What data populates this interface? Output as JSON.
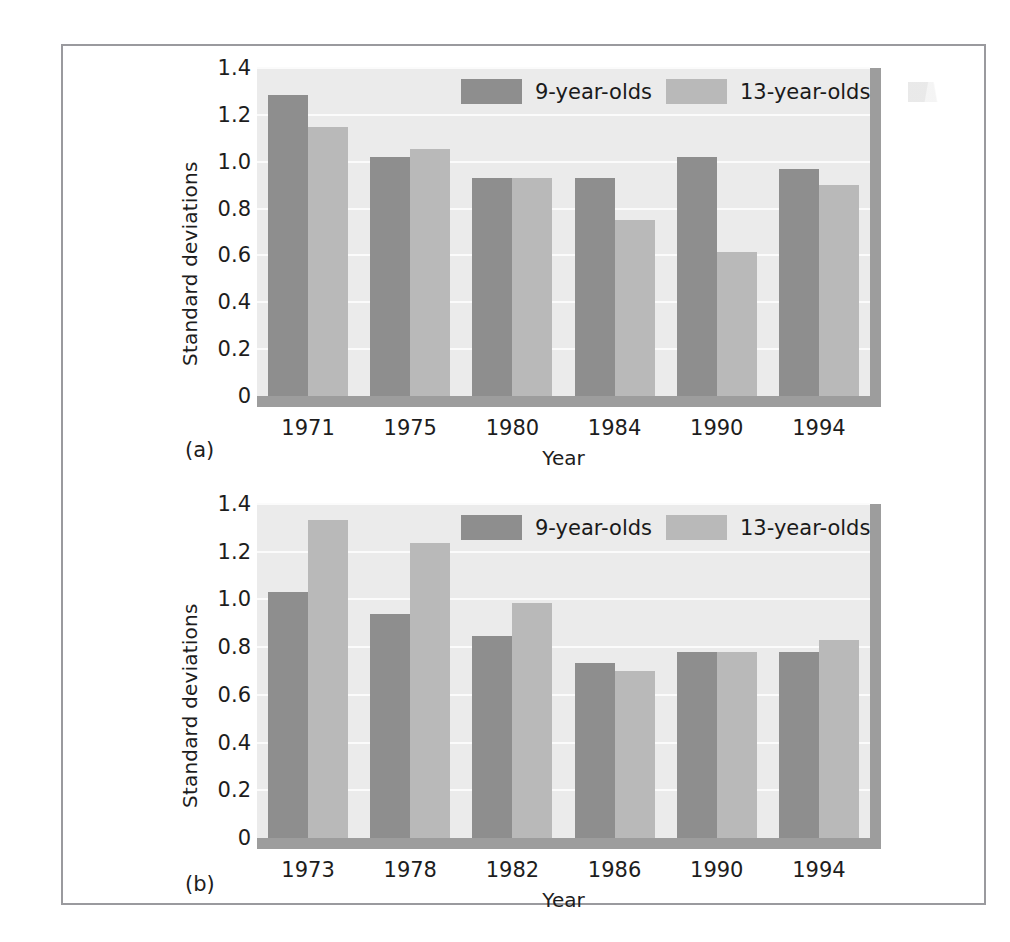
{
  "figure": {
    "panels": [
      {
        "caption": "(a)",
        "ylabel": "Standard deviations",
        "xlabel": "Year",
        "legend": [
          {
            "label": "9-year-olds",
            "color": "#8e8e8e"
          },
          {
            "label": "13-year-olds",
            "color": "#b9b9b9"
          }
        ]
      },
      {
        "caption": "(b)",
        "ylabel": "Standard deviations",
        "xlabel": "Year",
        "legend": [
          {
            "label": "9-year-olds",
            "color": "#8e8e8e"
          },
          {
            "label": "13-year-olds",
            "color": "#b9b9b9"
          }
        ]
      }
    ]
  },
  "chart_data": [
    {
      "type": "bar",
      "title": "(a)",
      "xlabel": "Year",
      "ylabel": "Standard deviations",
      "categories": [
        "1971",
        "1975",
        "1980",
        "1984",
        "1990",
        "1994"
      ],
      "series": [
        {
          "name": "9-year-olds",
          "color": "#8e8e8e",
          "values": [
            1.285,
            1.02,
            0.93,
            0.93,
            1.02,
            0.97
          ]
        },
        {
          "name": "13-year-olds",
          "color": "#b9b9b9",
          "values": [
            1.15,
            1.055,
            0.93,
            0.75,
            0.615,
            0.9
          ]
        }
      ],
      "ylim": [
        0,
        1.4
      ],
      "yticks": [
        "0",
        "0.2",
        "0.4",
        "0.6",
        "0.8",
        "1.0",
        "1.2",
        "1.4"
      ],
      "ytick_values": [
        0,
        0.2,
        0.4,
        0.6,
        0.8,
        1.0,
        1.2,
        1.4
      ],
      "grid": true,
      "legend_position": "top-right"
    },
    {
      "type": "bar",
      "title": "(b)",
      "xlabel": "Year",
      "ylabel": "Standard deviations",
      "categories": [
        "1973",
        "1978",
        "1982",
        "1986",
        "1990",
        "1994"
      ],
      "series": [
        {
          "name": "9-year-olds",
          "color": "#8e8e8e",
          "values": [
            1.03,
            0.94,
            0.845,
            0.735,
            0.78,
            0.78
          ]
        },
        {
          "name": "13-year-olds",
          "color": "#b9b9b9",
          "values": [
            1.335,
            1.235,
            0.985,
            0.7,
            0.78,
            0.83
          ]
        }
      ],
      "ylim": [
        0,
        1.4
      ],
      "yticks": [
        "0",
        "0.2",
        "0.4",
        "0.6",
        "0.8",
        "1.0",
        "1.2",
        "1.4"
      ],
      "ytick_values": [
        0,
        0.2,
        0.4,
        0.6,
        0.8,
        1.0,
        1.2,
        1.4
      ],
      "grid": true,
      "legend_position": "top-right"
    }
  ]
}
